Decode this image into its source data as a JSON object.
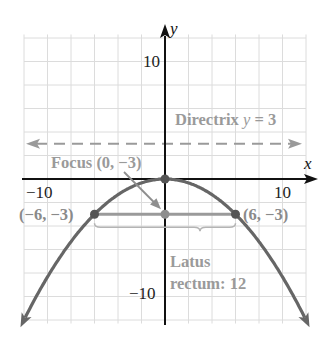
{
  "chart_data": {
    "type": "line",
    "title": "",
    "xlabel": "x",
    "ylabel": "y",
    "xlim": [
      -12,
      12
    ],
    "ylim": [
      -12.3,
      12.3
    ],
    "grid": true,
    "grid_step": 2,
    "x_tick_labels": [
      {
        "value": -10,
        "label": "−10"
      },
      {
        "value": 10,
        "label": "10"
      }
    ],
    "y_tick_labels": [
      {
        "value": 10,
        "label": "10"
      },
      {
        "value": -10,
        "label": "−10"
      }
    ],
    "series": [
      {
        "name": "Parabola x^2 = -12y",
        "equation": "y = -x^2/12",
        "x_range": [
          -11.9,
          11.9
        ],
        "color": "#666666"
      },
      {
        "name": "Directrix y = 3",
        "equation": "y = 3",
        "style": "dashed",
        "color": "#9a9a9a"
      },
      {
        "name": "Latus rectum",
        "points": [
          [
            -6,
            -3
          ],
          [
            6,
            -3
          ]
        ],
        "color": "#9a9a9a"
      }
    ],
    "points": [
      {
        "x": 0,
        "y": 0,
        "label": ""
      },
      {
        "x": 0,
        "y": -3,
        "label": "Focus (0, −3)"
      },
      {
        "x": -6,
        "y": -3,
        "label": "(−6, −3)"
      },
      {
        "x": 6,
        "y": -3,
        "label": "(6, −3)"
      }
    ],
    "annotations": [
      {
        "text": "Directrix y = 3"
      },
      {
        "text": "Focus (0, −3)"
      },
      {
        "text": "Latus rectum: 12"
      }
    ]
  },
  "labels": {
    "x_axis": "x",
    "y_axis": "y",
    "x_tick_neg": "−10",
    "x_tick_pos": "10",
    "y_tick_pos": "10",
    "y_tick_neg": "−10",
    "directrix_prefix": "Directrix ",
    "directrix_var": "y",
    "directrix_suffix": " = 3",
    "focus": "Focus (0, −3)",
    "left_point": "(−6, −3)",
    "right_point": "(6, −3)",
    "latus_line1": "Latus",
    "latus_line2": "rectum: 12"
  },
  "colors": {
    "grid": "#dcdcdc",
    "axis": "#111111",
    "curve": "#666666",
    "annotation": "#9a9a9a",
    "point_dark": "#555555",
    "point_light": "#8e8e8e"
  }
}
